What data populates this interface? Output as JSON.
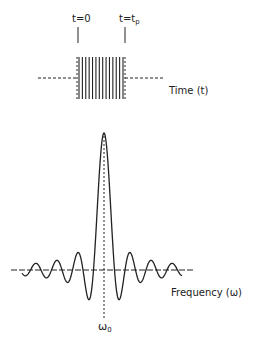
{
  "time_domain": {
    "marker_start_label": "t=0",
    "marker_end_label_main": "t=t",
    "marker_end_label_sub": "p",
    "axis_label": "Time (t)",
    "pulse_lines": 14
  },
  "frequency_domain": {
    "axis_label": "Frequency (ω)",
    "center_label_main": "ω",
    "center_label_sub": "0",
    "description": "sinc-shaped spectrum centered at ω0 with decaying side lobes"
  },
  "colors": {
    "ink": "#222222",
    "background": "#ffffff"
  }
}
